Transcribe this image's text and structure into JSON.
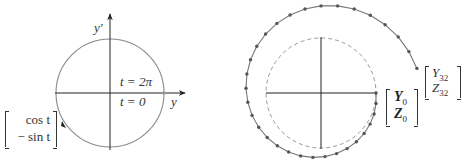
{
  "left_figure": {
    "axis_y_label": "y",
    "axis_yprime_label": "y′",
    "label_t_2pi": "t = 2π",
    "label_t_0": "t = 0",
    "vector_top": "cos t",
    "vector_bottom": "− sin t",
    "circle": {
      "cx": 110,
      "cy": 93,
      "r": 54,
      "color": "#8a8a8a"
    }
  },
  "right_figure": {
    "start_label_top": "Y",
    "start_label_top_sub": "0",
    "start_label_bottom": "Z",
    "start_label_bottom_sub": "0",
    "end_label_top": "Y",
    "end_label_top_sub": "32",
    "end_label_bottom": "Z",
    "end_label_bottom_sub": "32",
    "dashed_circle": {
      "cx": 321,
      "cy": 93,
      "r": 55
    },
    "num_steps": 32,
    "dot_color": "#555555"
  }
}
